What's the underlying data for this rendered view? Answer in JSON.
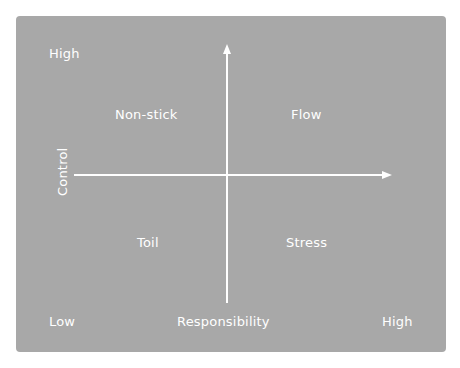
{
  "diagram": {
    "type": "quadrant",
    "background_color": "#a8a8a8",
    "foreground_color": "#ffffff",
    "y_axis": {
      "label": "Control",
      "high_label": "High"
    },
    "x_axis": {
      "label": "Responsibility",
      "low_label": "Low",
      "high_label": "High"
    },
    "quadrants": {
      "top_left": "Non-stick",
      "top_right": "Flow",
      "bottom_left": "Toil",
      "bottom_right": "Stress"
    }
  }
}
